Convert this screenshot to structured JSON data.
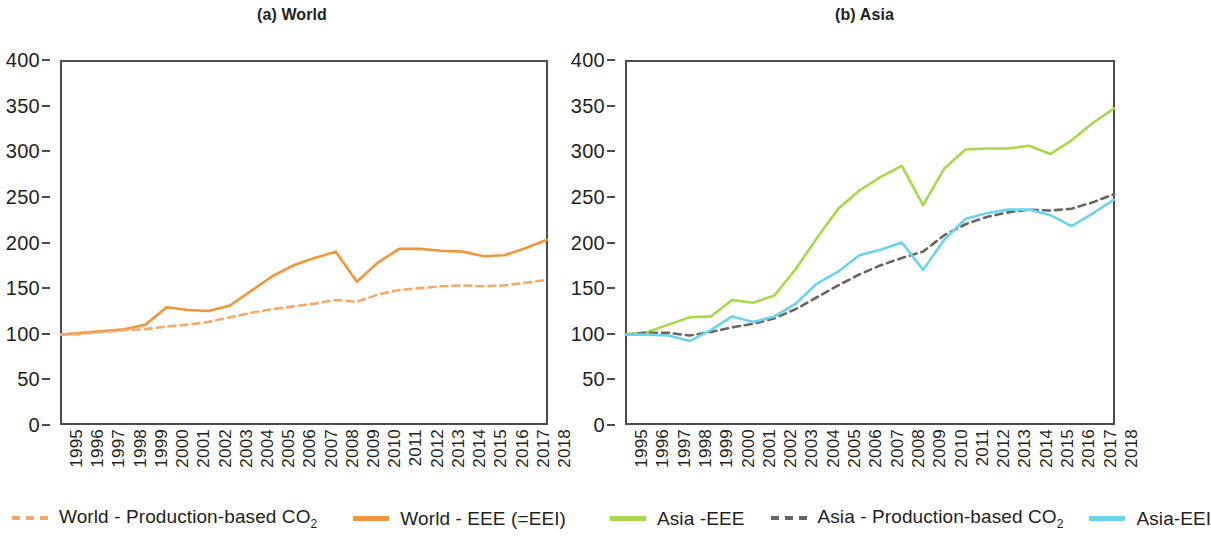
{
  "figure": {
    "panels": [
      {
        "title": "(a) World"
      },
      {
        "title": "(b) Asia"
      }
    ]
  },
  "axis": {
    "y_ticks": [
      "400",
      "350",
      "300",
      "250",
      "200",
      "150",
      "100",
      "50",
      "0"
    ],
    "x_ticks": [
      "1995",
      "1996",
      "1997",
      "1998",
      "1999",
      "2000",
      "2001",
      "2002",
      "2003",
      "2004",
      "2005",
      "2006",
      "2007",
      "2008",
      "2009",
      "2010",
      "2011",
      "2012",
      "2013",
      "2014",
      "2015",
      "2016",
      "2017",
      "2018"
    ]
  },
  "legend": {
    "items": [
      {
        "label": "World - Production-based CO",
        "sub": "2",
        "style": "dashed",
        "color": "#F4A96B",
        "name": "world-production-co2"
      },
      {
        "label": "World - EEE (=EEI)",
        "sub": "",
        "style": "solid",
        "color": "#F0963C",
        "name": "world-eee"
      },
      {
        "label": "Asia -EEE",
        "sub": "",
        "style": "solid",
        "color": "#A8D849",
        "name": "asia-eee"
      },
      {
        "label": "Asia - Production-based CO",
        "sub": "2",
        "style": "dashed",
        "color": "#6B6560",
        "name": "asia-production-co2"
      },
      {
        "label": "Asia-EEI",
        "sub": "",
        "style": "solid",
        "color": "#6DD3ED",
        "name": "asia-eei"
      }
    ]
  },
  "colors": {
    "world_eee": "#F0963C",
    "world_production_co2": "#F4A96B",
    "asia_eee": "#A8D849",
    "asia_production_co2": "#6B6560",
    "asia_eei": "#6DD3ED",
    "axis": "#4c4c4c",
    "text": "#231f20"
  },
  "chart_data": [
    {
      "type": "line",
      "title": "(a) World",
      "xlabel": "",
      "ylabel": "",
      "xlim": [
        1995,
        2018
      ],
      "ylim": [
        0,
        400
      ],
      "ytick_step": 50,
      "grid": false,
      "legend_position": "bottom",
      "x": [
        1995,
        1996,
        1997,
        1998,
        1999,
        2000,
        2001,
        2002,
        2003,
        2004,
        2005,
        2006,
        2007,
        2008,
        2009,
        2010,
        2011,
        2012,
        2013,
        2014,
        2015,
        2016,
        2017,
        2018
      ],
      "series": [
        {
          "name": "World - EEE (=EEI)",
          "color": "#F0963C",
          "style": "solid",
          "values": [
            99,
            101,
            103,
            105,
            110,
            129,
            126,
            125,
            131,
            147,
            163,
            175,
            183,
            190,
            157,
            178,
            193,
            193,
            191,
            190,
            185,
            186,
            194,
            203
          ]
        },
        {
          "name": "World - Production-based CO2",
          "color": "#F4A96B",
          "style": "dashed",
          "values": [
            99,
            100,
            102,
            104,
            105,
            108,
            110,
            113,
            118,
            123,
            127,
            130,
            133,
            137,
            135,
            143,
            148,
            150,
            152,
            153,
            152,
            153,
            156,
            159
          ]
        }
      ]
    },
    {
      "type": "line",
      "title": "(b) Asia",
      "xlabel": "",
      "ylabel": "",
      "xlim": [
        1995,
        2018
      ],
      "ylim": [
        0,
        400
      ],
      "ytick_step": 50,
      "grid": false,
      "legend_position": "bottom",
      "x": [
        1995,
        1996,
        1997,
        1998,
        1999,
        2000,
        2001,
        2002,
        2003,
        2004,
        2005,
        2006,
        2007,
        2008,
        2009,
        2010,
        2011,
        2012,
        2013,
        2014,
        2015,
        2016,
        2017,
        2018
      ],
      "series": [
        {
          "name": "Asia -EEE",
          "color": "#A8D849",
          "style": "solid",
          "values": [
            99,
            102,
            110,
            118,
            119,
            137,
            134,
            142,
            171,
            205,
            237,
            257,
            272,
            284,
            241,
            281,
            302,
            303,
            303,
            306,
            297,
            312,
            331,
            347
          ]
        },
        {
          "name": "Asia - Production-based CO2",
          "color": "#6B6560",
          "style": "dashed",
          "values": [
            99,
            101,
            101,
            98,
            102,
            107,
            111,
            117,
            127,
            140,
            153,
            165,
            175,
            183,
            190,
            208,
            220,
            228,
            233,
            236,
            235,
            237,
            244,
            253
          ]
        },
        {
          "name": "Asia-EEI",
          "color": "#6DD3ED",
          "style": "solid",
          "values": [
            99,
            99,
            98,
            92,
            104,
            119,
            113,
            119,
            133,
            155,
            168,
            186,
            192,
            200,
            170,
            203,
            226,
            232,
            236,
            236,
            230,
            218,
            232,
            247
          ]
        }
      ]
    }
  ]
}
